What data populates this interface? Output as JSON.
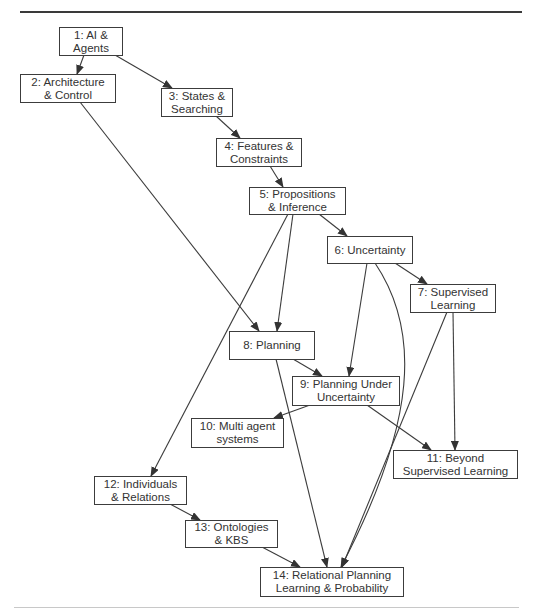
{
  "diagram": {
    "type": "dependency-graph",
    "nodes": [
      {
        "id": 1,
        "label": "1: AI &\nAgents"
      },
      {
        "id": 2,
        "label": "2: Architecture\n& Control"
      },
      {
        "id": 3,
        "label": "3: States &\nSearching"
      },
      {
        "id": 4,
        "label": "4: Features &\nConstraints"
      },
      {
        "id": 5,
        "label": "5: Propositions\n& Inference"
      },
      {
        "id": 6,
        "label": "6: Uncertainty"
      },
      {
        "id": 7,
        "label": "7: Supervised\nLearning"
      },
      {
        "id": 8,
        "label": "8: Planning"
      },
      {
        "id": 9,
        "label": "9: Planning Under\nUncertainty"
      },
      {
        "id": 10,
        "label": "10: Multi agent\nsystems"
      },
      {
        "id": 11,
        "label": "11: Beyond\nSupervised Learning"
      },
      {
        "id": 12,
        "label": "12: Individuals\n& Relations"
      },
      {
        "id": 13,
        "label": "13: Ontologies\n& KBS"
      },
      {
        "id": 14,
        "label": "14: Relational Planning\nLearning & Probability"
      }
    ],
    "edges": [
      {
        "from": 1,
        "to": 2
      },
      {
        "from": 1,
        "to": 3
      },
      {
        "from": 3,
        "to": 4
      },
      {
        "from": 4,
        "to": 5
      },
      {
        "from": 2,
        "to": 8
      },
      {
        "from": 5,
        "to": 6
      },
      {
        "from": 5,
        "to": 8
      },
      {
        "from": 5,
        "to": 12
      },
      {
        "from": 6,
        "to": 7
      },
      {
        "from": 6,
        "to": 9
      },
      {
        "from": 6,
        "to": 14
      },
      {
        "from": 7,
        "to": 11
      },
      {
        "from": 7,
        "to": 14
      },
      {
        "from": 8,
        "to": 9
      },
      {
        "from": 8,
        "to": 14
      },
      {
        "from": 9,
        "to": 10
      },
      {
        "from": 9,
        "to": 11
      },
      {
        "from": 12,
        "to": 13
      },
      {
        "from": 13,
        "to": 14
      }
    ],
    "colors": {
      "line": "#3c3c3c",
      "box_border": "#3c3c3c",
      "text": "#333333",
      "background": "#ffffff"
    }
  }
}
